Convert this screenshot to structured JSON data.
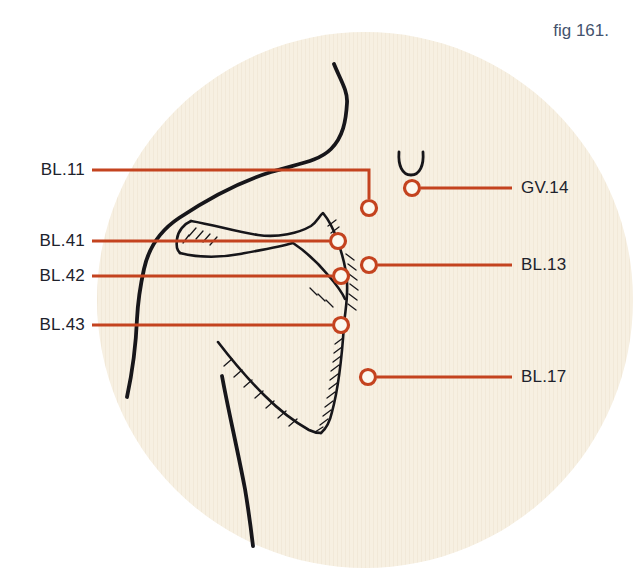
{
  "caption": "fig 161.",
  "labels": {
    "left": [
      {
        "text": "BL.11"
      },
      {
        "text": "BL.41"
      },
      {
        "text": "BL.42"
      },
      {
        "text": "BL.43"
      }
    ],
    "right": [
      {
        "text": "GV.14"
      },
      {
        "text": "BL.13"
      },
      {
        "text": "BL.17"
      }
    ]
  },
  "colors": {
    "page_white": "#ffffff",
    "disc_beige": "#f7f0e2",
    "ink": "#17161a",
    "label_ink": "#20222c",
    "caption_blue": "#44536e",
    "leader_red": "#c4431f",
    "marker_fill": "#fcf8ee"
  }
}
